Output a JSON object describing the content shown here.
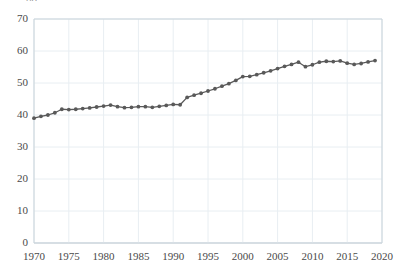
{
  "chart_data": {
    "type": "line",
    "title": "",
    "subtitle": "",
    "xlabel": "",
    "ylabel": "",
    "xlim": [
      1970,
      2020
    ],
    "ylim": [
      0,
      70
    ],
    "grid": true,
    "legend_position": "none",
    "series_color": "#595959",
    "marker": "circle",
    "x_ticks": [
      "1970",
      "1975",
      "1980",
      "1985",
      "1990",
      "1995",
      "2000",
      "2005",
      "2010",
      "2015",
      "2020"
    ],
    "x_tick_values": [
      1970,
      1975,
      1980,
      1985,
      1990,
      1995,
      2000,
      2005,
      2010,
      2015,
      2020
    ],
    "y_ticks": [
      "0",
      "10",
      "20",
      "30",
      "40",
      "50",
      "60",
      "70"
    ],
    "y_tick_values": [
      0,
      10,
      20,
      30,
      40,
      50,
      60,
      70
    ],
    "clipped_top_label": "80",
    "x": [
      1970,
      1971,
      1972,
      1973,
      1974,
      1975,
      1976,
      1977,
      1978,
      1979,
      1980,
      1981,
      1982,
      1983,
      1984,
      1985,
      1986,
      1987,
      1988,
      1989,
      1990,
      1991,
      1992,
      1993,
      1994,
      1995,
      1996,
      1997,
      1998,
      1999,
      2000,
      2001,
      2002,
      2003,
      2004,
      2005,
      2006,
      2007,
      2008,
      2009,
      2010,
      2011,
      2012,
      2013,
      2014,
      2015,
      2016,
      2017,
      2018,
      2019
    ],
    "values": [
      39.0,
      39.6,
      40.0,
      40.7,
      41.8,
      41.7,
      41.8,
      42.0,
      42.2,
      42.5,
      42.8,
      43.1,
      42.6,
      42.3,
      42.4,
      42.6,
      42.6,
      42.4,
      42.7,
      43.0,
      43.3,
      43.2,
      45.5,
      46.2,
      46.8,
      47.5,
      48.2,
      49.0,
      49.8,
      50.8,
      52.0,
      52.1,
      52.6,
      53.2,
      53.8,
      54.5,
      55.2,
      55.8,
      56.5,
      55.1,
      55.7,
      56.5,
      56.8,
      56.7,
      56.9,
      56.2,
      55.8,
      56.1,
      56.6,
      57.0
    ],
    "series": [
      {
        "name": "series-1",
        "values": [
          39.0,
          39.6,
          40.0,
          40.7,
          41.8,
          41.7,
          41.8,
          42.0,
          42.2,
          42.5,
          42.8,
          43.1,
          42.6,
          42.3,
          42.4,
          42.6,
          42.6,
          42.4,
          42.7,
          43.0,
          43.3,
          43.2,
          45.5,
          46.2,
          46.8,
          47.5,
          48.2,
          49.0,
          49.8,
          50.8,
          52.0,
          52.1,
          52.6,
          53.2,
          53.8,
          54.5,
          55.2,
          55.8,
          56.5,
          55.1,
          55.7,
          56.5,
          56.8,
          56.7,
          56.9,
          56.2,
          55.8,
          56.1,
          56.6,
          57.0
        ]
      }
    ],
    "annotations": [],
    "colors": {
      "line": "#595959",
      "marker": "#595959",
      "grid": "#e8eef2",
      "axis": "#c9d3da",
      "tick_text": "#4a4a4a",
      "background": "#ffffff"
    },
    "plot_area": {
      "left": 34,
      "right": 382,
      "top": 19,
      "bottom": 243
    }
  }
}
